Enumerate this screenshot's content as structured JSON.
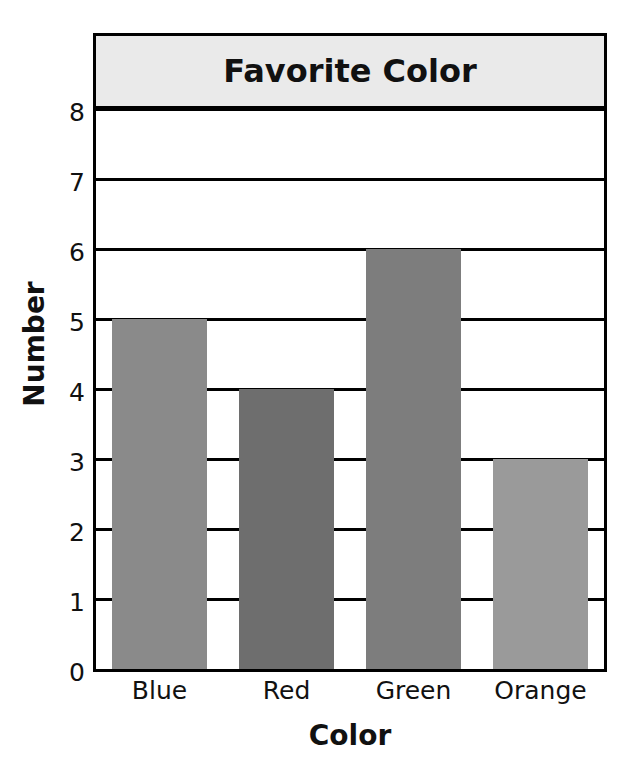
{
  "chart_data": {
    "type": "bar",
    "title": "Favorite Color",
    "xlabel": "Color",
    "ylabel": "Number",
    "categories": [
      "Blue",
      "Red",
      "Green",
      "Orange"
    ],
    "values": [
      5,
      4,
      6,
      3
    ],
    "ylim": [
      0,
      8
    ],
    "yticks": [
      0,
      1,
      2,
      3,
      4,
      5,
      6,
      7,
      8
    ],
    "ytick_labels": [
      "0",
      "1",
      "2",
      "3",
      "4",
      "5",
      "6",
      "7",
      "8"
    ],
    "grid": true,
    "legend": false,
    "bar_colors": [
      "#8a8a8a",
      "#6e6e6e",
      "#7d7d7d",
      "#9a9a9a"
    ],
    "series": [
      {
        "name": "Number",
        "values": [
          5,
          4,
          6,
          3
        ]
      }
    ]
  },
  "style": {
    "title_background": "#eaeaea",
    "frame_color": "#000000",
    "text_color": "#111111",
    "plot_background": "#ffffff"
  }
}
